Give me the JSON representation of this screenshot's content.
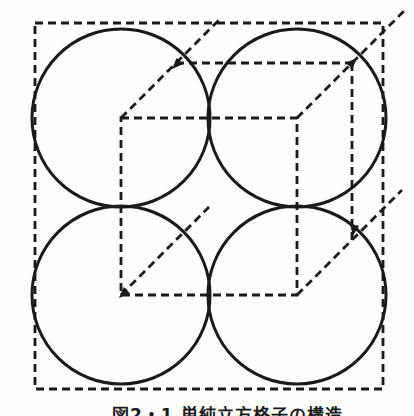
{
  "page": {
    "background": "#fdfdfb"
  },
  "caption": {
    "text": "図2・1 単純立方格子の構造"
  },
  "figure": {
    "stroke_color": "#1a1a1a",
    "dash_pattern": "8 5",
    "dashed_stroke_width": 2.8,
    "solid_stroke_width": 3,
    "elements": [
      {
        "name": "outer-boundary-square",
        "type": "rect",
        "x": 35,
        "y": 23,
        "w": 348,
        "h": 366,
        "dashed": true
      },
      {
        "name": "atom-circle-top-left",
        "type": "circle",
        "cx": 121,
        "cy": 118,
        "r": 89
      },
      {
        "name": "atom-circle-top-right",
        "type": "circle",
        "cx": 297,
        "cy": 118,
        "r": 89
      },
      {
        "name": "atom-circle-bottom-left",
        "type": "circle",
        "cx": 121,
        "cy": 295,
        "r": 89
      },
      {
        "name": "atom-circle-bottom-right",
        "type": "circle",
        "cx": 297,
        "cy": 295,
        "r": 89
      },
      {
        "name": "unit-cell-front-face",
        "type": "rect",
        "x": 121,
        "y": 118,
        "w": 176,
        "h": 177,
        "dashed": true
      },
      {
        "name": "unit-cell-back-top-edge",
        "type": "line",
        "x1": 176,
        "y1": 63,
        "x2": 352,
        "y2": 63,
        "dashed": true
      },
      {
        "name": "unit-cell-back-right-edge",
        "type": "line",
        "x1": 352,
        "y1": 63,
        "x2": 352,
        "y2": 240,
        "dashed": true
      },
      {
        "name": "receding-edge-top-left",
        "type": "line",
        "x1": 121,
        "y1": 118,
        "x2": 221,
        "y2": 18,
        "dashed": true
      },
      {
        "name": "receding-edge-top-right",
        "type": "line",
        "x1": 297,
        "y1": 118,
        "x2": 404,
        "y2": 11,
        "dashed": true
      },
      {
        "name": "receding-edge-bottom-left",
        "type": "line",
        "x1": 121,
        "y1": 295,
        "x2": 209,
        "y2": 207,
        "dashed": true
      },
      {
        "name": "receding-edge-bottom-right",
        "type": "line",
        "x1": 297,
        "y1": 295,
        "x2": 402,
        "y2": 190,
        "dashed": true
      },
      {
        "name": "arrow-mark-back-top-left",
        "type": "arrow",
        "x": 177,
        "y": 64,
        "angle": 135
      },
      {
        "name": "arrow-mark-back-top-right",
        "type": "arrow",
        "x": 352,
        "y": 63,
        "angle": -45
      },
      {
        "name": "arrow-mark-back-right-bottom",
        "type": "arrow",
        "x": 354,
        "y": 229,
        "angle": 100
      },
      {
        "name": "arrow-mark-front-bottom-left",
        "type": "arrow",
        "x": 124,
        "y": 293,
        "angle": 135
      }
    ]
  }
}
